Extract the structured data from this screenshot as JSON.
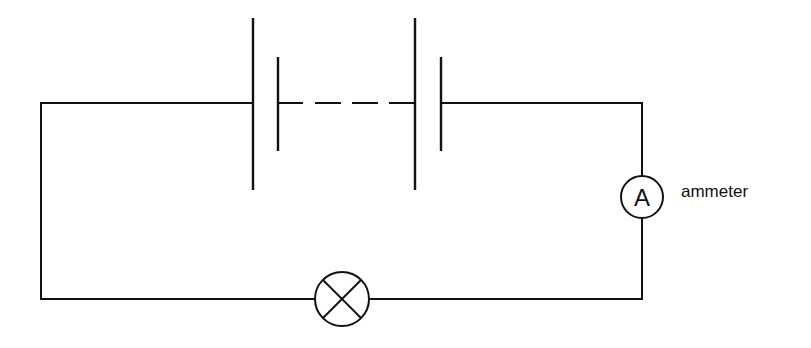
{
  "diagram": {
    "type": "circuit",
    "stroke_color": "#111111",
    "background": "#ffffff",
    "components": {
      "battery": {
        "kind": "battery-of-cells",
        "cells_shown": 2,
        "gap_indicated_by": "dashed line"
      },
      "ammeter": {
        "kind": "ammeter",
        "symbol_letter": "A",
        "label": "ammeter"
      },
      "lamp": {
        "kind": "lamp",
        "symbol": "circle-with-cross"
      }
    }
  }
}
